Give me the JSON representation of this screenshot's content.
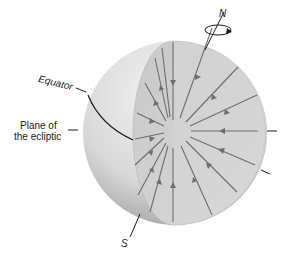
{
  "labels": {
    "north": "N",
    "south": "S",
    "equator": "Equator",
    "ecliptic_line1": "Plane of",
    "ecliptic_line2": "the ecliptic"
  },
  "colors": {
    "background": "#ffffff",
    "sphere_light": "#ececec",
    "sphere_dark": "#a8a8a8",
    "cut_face": "#cfcfcf",
    "arrows": "#6e6e6e",
    "lines": "#1a1a1a"
  }
}
